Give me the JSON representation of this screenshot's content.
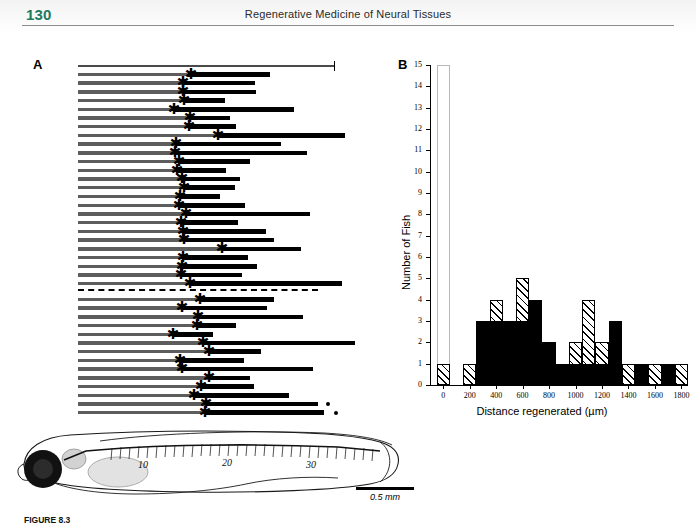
{
  "header": {
    "page_number": "130",
    "running_title": "Regenerative Medicine of Neural Tissues"
  },
  "panels": {
    "a_label": "A",
    "b_label": "B"
  },
  "panel_a": {
    "description": "Horizontal bar rows: grey proximal segment, black regenerated segment, asterisk marker at lesion site",
    "marker_asterisk": "✱",
    "rows": [
      {
        "grey_end": 0,
        "black_start": 0,
        "black_end": 0,
        "thin_start": 0,
        "thin_end": 256,
        "tick_at": 256,
        "ast": null,
        "dot": null
      },
      {
        "grey_end": 110,
        "black_start": 110,
        "black_end": 192,
        "ast": 113,
        "dot": null
      },
      {
        "grey_end": 104,
        "black_start": 104,
        "black_end": 177,
        "ast": 105,
        "dot": null
      },
      {
        "grey_end": 105,
        "black_start": 105,
        "black_end": 178,
        "ast": 105,
        "dot": null
      },
      {
        "grey_end": 106,
        "black_start": 106,
        "black_end": 147,
        "ast": 106,
        "dot": null
      },
      {
        "grey_end": 96,
        "black_start": 96,
        "black_end": 216,
        "ast": 96,
        "dot": null
      },
      {
        "grey_end": 112,
        "black_start": 112,
        "black_end": 152,
        "ast": 112,
        "dot": null
      },
      {
        "grey_end": 112,
        "black_start": 112,
        "black_end": 158,
        "ast": 111,
        "dot": null
      },
      {
        "grey_end": 140,
        "black_start": 140,
        "black_end": 267,
        "ast": 140,
        "dot": null
      },
      {
        "grey_end": 98,
        "black_start": 98,
        "black_end": 203,
        "ast": 98,
        "dot": null
      },
      {
        "grey_end": 97,
        "black_start": 97,
        "black_end": 229,
        "ast": 97,
        "dot": null
      },
      {
        "grey_end": 101,
        "black_start": 101,
        "black_end": 172,
        "ast": 101,
        "dot": null
      },
      {
        "grey_end": 99,
        "black_start": 99,
        "black_end": 148,
        "ast": 99,
        "dot": null
      },
      {
        "grey_end": 104,
        "black_start": 104,
        "black_end": 162,
        "ast": 104,
        "dot": null
      },
      {
        "grey_end": 106,
        "black_start": 106,
        "black_end": 157,
        "ast": 106,
        "dot": null
      },
      {
        "grey_end": 102,
        "black_start": 102,
        "black_end": 142,
        "ast": 102,
        "dot": null
      },
      {
        "grey_end": 101,
        "black_start": 101,
        "black_end": 167,
        "ast": 101,
        "dot": null
      },
      {
        "grey_end": 108,
        "black_start": 108,
        "black_end": 232,
        "ast": 108,
        "dot": null
      },
      {
        "grey_end": 103,
        "black_start": 103,
        "black_end": 160,
        "ast": 103,
        "dot": null
      },
      {
        "grey_end": 105,
        "black_start": 105,
        "black_end": 188,
        "ast": 105,
        "dot": null
      },
      {
        "grey_end": 106,
        "black_start": 106,
        "black_end": 196,
        "ast": 106,
        "dot": null
      },
      {
        "grey_end": 144,
        "black_start": 144,
        "black_end": 223,
        "ast": 144,
        "dot": null
      },
      {
        "grey_end": 105,
        "black_start": 105,
        "black_end": 170,
        "ast": 105,
        "dot": null
      },
      {
        "grey_end": 104,
        "black_start": 104,
        "black_end": 179,
        "ast": 104,
        "dot": null
      },
      {
        "grey_end": 103,
        "black_start": 103,
        "black_end": 164,
        "ast": 103,
        "dot": null
      },
      {
        "grey_end": 113,
        "black_start": 113,
        "black_end": 264,
        "ast": 112,
        "dot": null
      },
      {
        "grey_end": 122,
        "black_start": 122,
        "black_end": 196,
        "ast": 122,
        "dot": null
      },
      {
        "grey_end": 104,
        "black_start": 104,
        "black_end": 189,
        "ast": 104,
        "dot": null
      },
      {
        "grey_end": 120,
        "black_start": 120,
        "black_end": 225,
        "ast": 120,
        "dot": null
      },
      {
        "grey_end": 119,
        "black_start": 119,
        "black_end": 158,
        "ast": 119,
        "dot": null
      },
      {
        "grey_end": 95,
        "black_start": 95,
        "black_end": 135,
        "ast": 95,
        "dot": null
      },
      {
        "grey_end": 125,
        "black_start": 125,
        "black_end": 277,
        "ast": 125,
        "dot": null
      },
      {
        "grey_end": 131,
        "black_start": 131,
        "black_end": 183,
        "ast": 131,
        "dot": null
      },
      {
        "grey_end": 102,
        "black_start": 102,
        "black_end": 166,
        "ast": 102,
        "dot": null
      },
      {
        "grey_end": 104,
        "black_start": 104,
        "black_end": 235,
        "ast": 104,
        "dot": null
      },
      {
        "grey_end": 131,
        "black_start": 131,
        "black_end": 172,
        "ast": 131,
        "dot": null
      },
      {
        "grey_end": 123,
        "black_start": 123,
        "black_end": 176,
        "ast": 123,
        "dot": null
      },
      {
        "grey_end": 116,
        "black_start": 116,
        "black_end": 211,
        "ast": 116,
        "dot": null
      },
      {
        "grey_end": 128,
        "black_start": 128,
        "black_end": 240,
        "ast": 128,
        "dot": 248
      },
      {
        "grey_end": 127,
        "black_start": 127,
        "black_end": 246,
        "ast": 127,
        "dot": 256
      }
    ],
    "divider_row_after": 25
  },
  "chart_data": {
    "type": "bar",
    "title": "",
    "xlabel": "Distance regenerated (µm)",
    "ylabel": "Number of Fish",
    "xlim": [
      -100,
      1850
    ],
    "ylim": [
      0,
      15
    ],
    "xticks": [
      0,
      200,
      400,
      600,
      800,
      1000,
      1200,
      1400,
      1600,
      1800
    ],
    "yticks": [
      0,
      1,
      2,
      3,
      4,
      5,
      6,
      7,
      8,
      9,
      10,
      11,
      12,
      13,
      14,
      15
    ],
    "grid": false,
    "legend": "none",
    "bin_width": 100,
    "series": [
      {
        "name": "Unlesioned control (open)",
        "style": "open",
        "bins": [
          {
            "x0": -50,
            "x1": 50,
            "value": 15
          }
        ]
      },
      {
        "name": "Regenerated (solid black)",
        "style": "solid",
        "bins": [
          {
            "x0": 250,
            "x1": 350,
            "value": 3
          },
          {
            "x0": 350,
            "x1": 450,
            "value": 3
          },
          {
            "x0": 450,
            "x1": 550,
            "value": 3
          },
          {
            "x0": 550,
            "x1": 650,
            "value": 3
          },
          {
            "x0": 650,
            "x1": 750,
            "value": 4
          },
          {
            "x0": 750,
            "x1": 850,
            "value": 2
          },
          {
            "x0": 850,
            "x1": 950,
            "value": 1
          },
          {
            "x0": 950,
            "x1": 1050,
            "value": 1
          },
          {
            "x0": 1050,
            "x1": 1150,
            "value": 1
          },
          {
            "x0": 1150,
            "x1": 1250,
            "value": 1
          },
          {
            "x0": 1250,
            "x1": 1350,
            "value": 3
          },
          {
            "x0": 1450,
            "x1": 1550,
            "value": 1
          },
          {
            "x0": 1650,
            "x1": 1750,
            "value": 1
          }
        ]
      },
      {
        "name": "Lesioned (hatched)",
        "style": "hatched",
        "bins": [
          {
            "x0": -50,
            "x1": 50,
            "value": 1
          },
          {
            "x0": 150,
            "x1": 250,
            "value": 1
          },
          {
            "x0": 350,
            "x1": 450,
            "value": 4
          },
          {
            "x0": 450,
            "x1": 550,
            "value": 2
          },
          {
            "x0": 550,
            "x1": 650,
            "value": 5
          },
          {
            "x0": 950,
            "x1": 1050,
            "value": 2
          },
          {
            "x0": 1050,
            "x1": 1150,
            "value": 4
          },
          {
            "x0": 1150,
            "x1": 1250,
            "value": 2
          },
          {
            "x0": 1350,
            "x1": 1450,
            "value": 1
          },
          {
            "x0": 1550,
            "x1": 1650,
            "value": 1
          },
          {
            "x0": 1750,
            "x1": 1850,
            "value": 1
          }
        ]
      }
    ]
  },
  "fish": {
    "somite_labels": [
      "10",
      "20",
      "30"
    ],
    "scale_bar_label": "0.5 mm"
  },
  "caption": {
    "figure_number": "FIGURE 8.3",
    "text": ""
  }
}
